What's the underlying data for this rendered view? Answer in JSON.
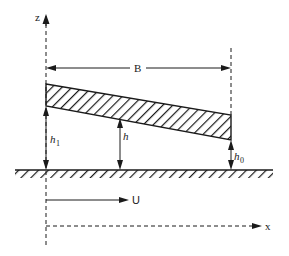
{
  "diagram": {
    "title": "",
    "labels": {
      "z_axis": "z",
      "x_axis": "x",
      "width": "B",
      "velocity": "U",
      "h1_main": "h",
      "h1_sub": "1",
      "h_main": "h",
      "h0_main": "h",
      "h0_sub": "0"
    },
    "colors": {
      "line": "#1a1a1a",
      "background": "#ffffff"
    },
    "elements": [
      "z-axis (dashed vertical with arrow up)",
      "inclined slider pad (hatched wedge)",
      "stationary surface (hatched ground)",
      "width dimension B",
      "film thickness h1 at inlet",
      "film thickness h at x",
      "film thickness h0 at outlet",
      "velocity U arrow",
      "x-axis (dashed horizontal with arrow right)"
    ]
  }
}
